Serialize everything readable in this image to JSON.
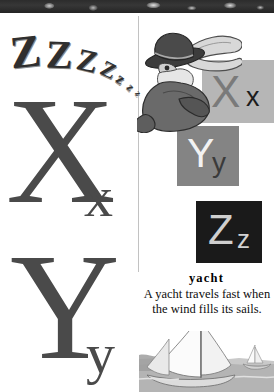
{
  "page": {
    "type": "alphabet-picture-book-page",
    "background_color": "#ffffff",
    "divider_color": "#c2c2c2",
    "binding_color": "#2c2c2c"
  },
  "left_column": {
    "snore_letters": [
      {
        "char": "Z",
        "size": 46,
        "x": 10,
        "y": 16,
        "rotate": -6
      },
      {
        "char": "Z",
        "size": 40,
        "x": 46,
        "y": 22,
        "rotate": 2
      },
      {
        "char": "Z",
        "size": 31,
        "x": 77,
        "y": 32,
        "rotate": 13
      },
      {
        "char": "Z",
        "size": 22,
        "x": 101,
        "y": 46,
        "rotate": 26
      },
      {
        "char": "z",
        "size": 16,
        "x": 117,
        "y": 58,
        "rotate": 38
      },
      {
        "char": "z",
        "size": 12,
        "x": 128,
        "y": 68,
        "rotate": 48
      },
      {
        "char": "z",
        "size": 9,
        "x": 135,
        "y": 76,
        "rotate": 56
      }
    ],
    "letters": [
      {
        "name": "letter-x",
        "capital": "X",
        "lowercase": "x",
        "capital_size": 150,
        "lowercase_size": 58,
        "capital_x": 8,
        "capital_y": 72,
        "lowercase_x": 86,
        "lowercase_y": 170,
        "color": "#4a4a4a"
      },
      {
        "name": "letter-y",
        "capital": "Y",
        "lowercase": "y",
        "capital_size": 150,
        "lowercase_size": 58,
        "capital_x": 10,
        "capital_y": 228,
        "lowercase_x": 86,
        "lowercase_y": 326,
        "color": "#4a4a4a"
      }
    ]
  },
  "right_column": {
    "blocks": [
      {
        "name": "block-x",
        "capital": "X",
        "lowercase": "x",
        "block_color": "#b6b6b6",
        "capital_color": "#7a7a7a",
        "lowercase_color": "#1c1c1c"
      },
      {
        "name": "block-y",
        "capital": "Y",
        "lowercase": "y",
        "block_color": "#848484",
        "capital_color": "#f2f2f2",
        "lowercase_color": "#3a3a3a"
      },
      {
        "name": "block-z",
        "capital": "Z",
        "lowercase": "z",
        "block_color": "#1a1a1a",
        "capital_color": "#cfcfcf",
        "lowercase_color": "#d2d2d2"
      }
    ],
    "character": {
      "name": "sleeping-man-illustration",
      "description": "sleeping man in bowler hat with flowing scarf"
    },
    "entry": {
      "word": "yacht",
      "definition": "A yacht travels fast when the wind fills its sails."
    },
    "illustration": {
      "name": "yacht-illustration",
      "description": "sailboat with white sails on grey water"
    }
  }
}
